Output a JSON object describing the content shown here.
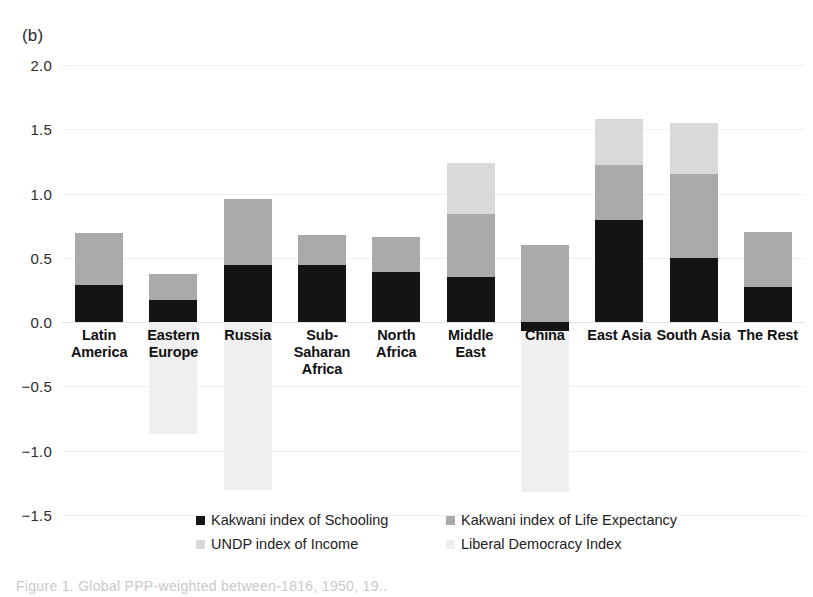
{
  "panel": {
    "label": "(b)"
  },
  "caption": {
    "text": "Figure 1. Global PPP-weighted between-1816, 1950, 19.."
  },
  "legend": {
    "position": "bottom",
    "entries": [
      {
        "label": "Kakwani index of Schooling",
        "color": "#141414"
      },
      {
        "label": "Kakwani index of Life Expectancy",
        "color": "#aaaaaa"
      },
      {
        "label": "UNDP index of Income",
        "color": "#d9d9d9"
      },
      {
        "label": "Liberal Democracy Index",
        "color": "#efefef"
      }
    ]
  },
  "chart_data": {
    "type": "bar",
    "stacked": true,
    "title": "",
    "xlabel": "",
    "ylabel": "",
    "ylim": [
      -1.75,
      2.0
    ],
    "yticks": [
      2.0,
      1.5,
      1.0,
      0.5,
      0.0,
      -0.5,
      -1.0,
      -1.5
    ],
    "ytick_labels": [
      "2.0",
      "1.5",
      "1.0",
      "0.5",
      "0.0",
      "−0.5",
      "−1.0",
      "−1.5"
    ],
    "grid": true,
    "categories": [
      "Latin America",
      "Eastern Europe",
      "Russia",
      "Sub-Saharan Africa",
      "North Africa",
      "Middle East",
      "China",
      "East Asia",
      "South Asia",
      "The Rest"
    ],
    "category_lines": [
      [
        "Latin",
        "America"
      ],
      [
        "Eastern",
        "Europe"
      ],
      [
        "Russia"
      ],
      [
        "Sub-",
        "Saharan",
        "Africa"
      ],
      [
        "North",
        "Africa"
      ],
      [
        "Middle",
        "East"
      ],
      [
        "China"
      ],
      [
        "East Asia"
      ],
      [
        "South Asia"
      ],
      [
        "The Rest"
      ]
    ],
    "series": [
      {
        "name": "Kakwani index of Schooling",
        "color": "#141414",
        "values": [
          0.29,
          0.17,
          0.44,
          0.44,
          0.39,
          0.35,
          -0.07,
          0.79,
          0.5,
          0.27
        ]
      },
      {
        "name": "Kakwani index of Life Expectancy",
        "color": "#aaaaaa",
        "values": [
          0.4,
          0.2,
          0.52,
          0.24,
          0.27,
          0.49,
          0.6,
          0.43,
          0.65,
          0.43
        ]
      },
      {
        "name": "UNDP index of Income",
        "color": "#d9d9d9",
        "values": [
          0.0,
          0.0,
          0.0,
          0.0,
          0.0,
          0.4,
          0.0,
          0.36,
          0.4,
          0.0
        ]
      },
      {
        "name": "Liberal Democracy Index",
        "color": "#efefef",
        "values": [
          0.0,
          -0.87,
          -1.31,
          0.0,
          0.0,
          0.0,
          -1.25,
          0.0,
          0.0,
          0.0
        ]
      }
    ]
  }
}
